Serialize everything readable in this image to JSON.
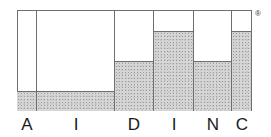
{
  "logo": {
    "letters": [
      "A",
      "I",
      "D",
      "I",
      "N",
      "C"
    ],
    "registered_mark": "®",
    "columns": [
      {
        "letter": "A",
        "x": 17,
        "width": 20,
        "fill_top": 91
      },
      {
        "letter": "I",
        "x": 37,
        "width": 78,
        "fill_top": 91
      },
      {
        "letter": "D",
        "x": 115,
        "width": 39,
        "fill_top": 61
      },
      {
        "letter": "I",
        "x": 154,
        "width": 40,
        "fill_top": 31
      },
      {
        "letter": "N",
        "x": 194,
        "width": 38,
        "fill_top": 61
      },
      {
        "letter": "C",
        "x": 232,
        "width": 20,
        "fill_top": 31
      }
    ],
    "colors": {
      "line": "#6e6e6e",
      "fill": "#d6d6d6",
      "text": "#1a1a1a"
    }
  }
}
